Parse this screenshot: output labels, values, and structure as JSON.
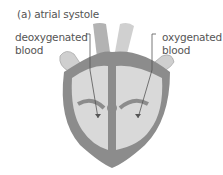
{
  "diagram": {
    "title": "(a) atrial systole",
    "labels": {
      "left_line1": "deoxygenated",
      "left_line2": "blood",
      "right_line1": "oxygenated",
      "right_line2": "blood"
    },
    "colors": {
      "outer_wall": "#8c8c8c",
      "chamber_fill": "#d9d9d9",
      "vessel_fill": "#c4c4c4",
      "text": "#555555"
    }
  }
}
